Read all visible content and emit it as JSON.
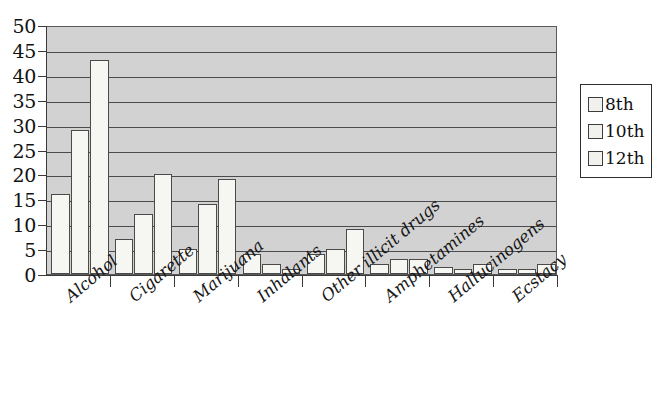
{
  "chart_data": {
    "type": "bar",
    "title": "",
    "xlabel": "",
    "ylabel": "",
    "ylim": [
      0,
      50
    ],
    "ytick_step": 5,
    "grid": true,
    "legend_position": "right",
    "orientation": "vertical",
    "grouping": "grouped",
    "categories": [
      "Alcohol",
      "Cigarette",
      "Marijuana",
      "Inhalants",
      "Other illicit drugs",
      "Amphetamines",
      "Hallucinogens",
      "Ecstacy"
    ],
    "ytick_labels": [
      "0",
      "5",
      "10",
      "15",
      "20",
      "25",
      "30",
      "35",
      "40",
      "45",
      "50"
    ],
    "series": [
      {
        "name": "8th",
        "values": [
          16,
          7,
          5,
          4,
          4,
          2,
          1.5,
          1
        ]
      },
      {
        "name": "10th",
        "values": [
          29,
          12,
          14,
          2,
          5,
          3,
          1,
          1
        ]
      },
      {
        "name": "12th",
        "values": [
          43,
          20,
          19,
          1,
          9,
          3,
          2,
          2
        ]
      }
    ],
    "colors": {
      "plot_background": "#d2d2d2",
      "bar_fill": "#f6f6f3",
      "bar_border": "#4a4a4a",
      "gridline": "#4b4b4b",
      "axis": "#3a3a3a",
      "text": "#121212"
    }
  },
  "legend": {
    "items": [
      {
        "label": "8th"
      },
      {
        "label": "10th"
      },
      {
        "label": "12th"
      }
    ]
  }
}
